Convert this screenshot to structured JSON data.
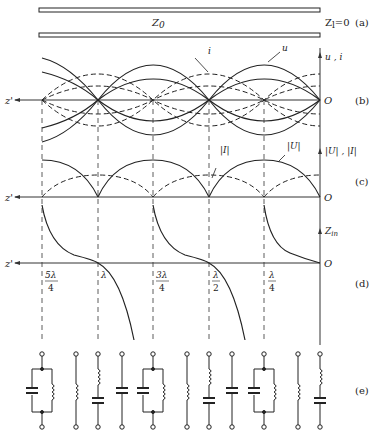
{
  "line": {
    "z0_label": "Z",
    "z0_sub": "0",
    "zl_label": "Z",
    "zl_sub": "l",
    "zl_value": "=0"
  },
  "panels": {
    "a": "(a)",
    "b": "(b)",
    "c": "(c)",
    "d": "(d)",
    "e": "(e)"
  },
  "axes": {
    "z_axis": "z'",
    "origin": "O",
    "b_ylabel": "u , i",
    "c_ylabel": "|U| , |I|",
    "d_ylabel": "Z",
    "d_ylabel_sub": "in"
  },
  "annotations": {
    "b_i": "i",
    "b_u": "u",
    "c_I": "|I|",
    "c_U": "|U|"
  },
  "ticks": [
    {
      "num": "5λ",
      "den": "4"
    },
    {
      "num": "λ",
      "den": ""
    },
    {
      "num": "3λ",
      "den": "4"
    },
    {
      "num": "λ",
      "den": "2"
    },
    {
      "num": "λ",
      "den": "4"
    }
  ],
  "circuits": [
    "parallel-LC",
    "inductor",
    "series-LC",
    "capacitor",
    "parallel-LC",
    "inductor",
    "series-LC",
    "capacitor",
    "parallel-LC",
    "inductor",
    "series-LC"
  ]
}
